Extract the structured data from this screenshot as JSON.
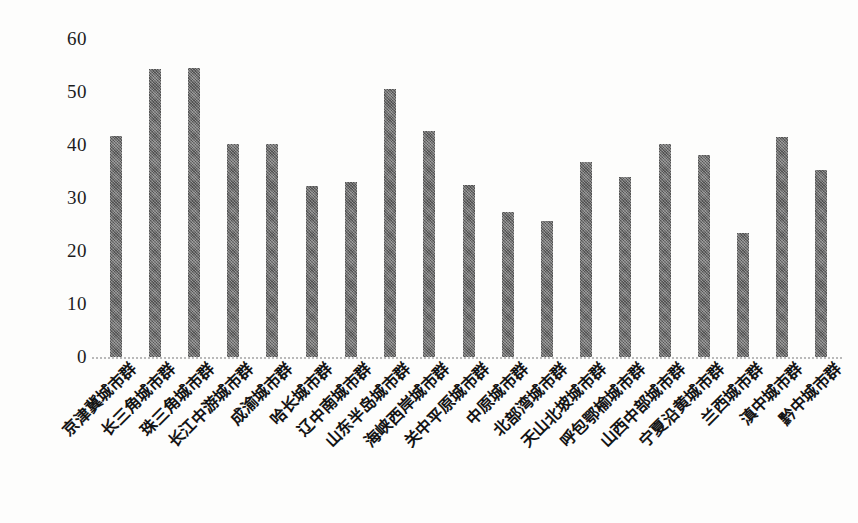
{
  "chart_data": {
    "type": "bar",
    "title": "",
    "subtitle": "",
    "xlabel": "",
    "ylabel": "",
    "ylim": [
      0,
      60
    ],
    "yticks": [
      60,
      50,
      40,
      30,
      20,
      10,
      0
    ],
    "ytick_labels": [
      "60",
      "50",
      "40",
      "30",
      "20",
      "10",
      "0"
    ],
    "grid": false,
    "legend": null,
    "bar_color": "#6d6d6d",
    "categories": [
      "京津冀城市群",
      "长三角城市群",
      "珠三角城市群",
      "长江中游城市群",
      "成渝城市群",
      "哈长城市群",
      "辽中南城市群",
      "山东半岛城市群",
      "海峡西岸城市群",
      "关中平原城市群",
      "中原城市群",
      "北部湾城市群",
      "天山北坡城市群",
      "呼包鄂榆城市群",
      "山西中部城市群",
      "宁夏沿黄城市群",
      "兰西城市群",
      "滇中城市群",
      "黔中城市群"
    ],
    "values": [
      41.7,
      54.3,
      54.6,
      40.1,
      40.1,
      32.3,
      33.1,
      50.5,
      42.7,
      32.5,
      27.4,
      25.6,
      36.8,
      33.9,
      40.2,
      38.1,
      23.4,
      41.6,
      35.2
    ]
  }
}
